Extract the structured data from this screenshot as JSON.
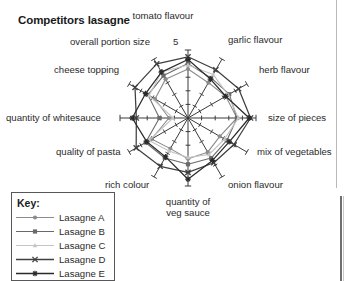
{
  "chart_title": "Competitors lasagne",
  "scale_top_label": "5",
  "legend": {
    "title": "Key:",
    "items": [
      {
        "label": "Lasagne A",
        "marker": "circle-marker",
        "color": "#8c8c8c"
      },
      {
        "label": "Lasagne B",
        "marker": "square-marker",
        "color": "#6a6a6a"
      },
      {
        "label": "Lasagne C",
        "marker": "triangle-marker",
        "color": "#c4c4c4"
      },
      {
        "label": "Lasagne D",
        "marker": "cross-marker",
        "color": "#3f3f3f"
      },
      {
        "label": "Lasagne E",
        "marker": "asterisk-marker",
        "color": "#2a2a2a"
      }
    ]
  },
  "chart_data": {
    "type": "radar",
    "title": "Competitors lasagne",
    "xlabel": "",
    "ylabel": "",
    "rlim": [
      0,
      5
    ],
    "r_ticks": [
      1,
      2,
      3,
      4,
      5
    ],
    "grid": false,
    "legend_position": "bottom-left",
    "categories": [
      "tomato flavour",
      "garlic flavour",
      "herb flavour",
      "size of pieces",
      "mix of vegetables",
      "onion flavour",
      "quantity of veg sauce",
      "rich colour",
      "quality of pasta",
      "quantity of whitesauce",
      "cheese topping",
      "overall portion size"
    ],
    "series": [
      {
        "name": "Lasagne A",
        "color": "#8c8c8c",
        "marker": "circle",
        "values": [
          3.6,
          3.0,
          3.2,
          3.6,
          2.7,
          2.9,
          3.0,
          2.6,
          3.1,
          1.4,
          2.8,
          3.3
        ]
      },
      {
        "name": "Lasagne B",
        "color": "#6a6a6a",
        "marker": "square",
        "values": [
          4.0,
          3.4,
          3.5,
          3.6,
          3.3,
          3.4,
          3.4,
          3.4,
          3.6,
          2.1,
          3.4,
          3.6
        ]
      },
      {
        "name": "Lasagne C",
        "color": "#c4c4c4",
        "marker": "triangle",
        "values": [
          3.9,
          3.7,
          3.4,
          3.7,
          3.1,
          3.1,
          2.9,
          2.8,
          3.3,
          1.1,
          3.3,
          3.9
        ]
      },
      {
        "name": "Lasagne D",
        "color": "#3f3f3f",
        "marker": "cross",
        "values": [
          4.5,
          4.1,
          4.3,
          4.6,
          3.9,
          3.8,
          4.0,
          4.1,
          4.4,
          3.8,
          4.5,
          4.6
        ]
      },
      {
        "name": "Lasagne E",
        "color": "#2a2a2a",
        "marker": "asterisk",
        "values": [
          4.3,
          3.3,
          3.2,
          4.5,
          3.5,
          3.6,
          4.5,
          3.3,
          3.5,
          4.1,
          3.6,
          3.9
        ]
      }
    ],
    "axis_label_positions": [
      {
        "label": "tomato flavour",
        "left": 163,
        "top": 10,
        "align": "center",
        "width": 0
      },
      {
        "label": "garlic flavour",
        "left": 228,
        "top": 34,
        "align": "left",
        "width": 0
      },
      {
        "label": "herb flavour",
        "left": 259,
        "top": 64,
        "align": "left",
        "width": 0
      },
      {
        "label": "size of pieces",
        "left": 268,
        "top": 112,
        "align": "left",
        "width": 0
      },
      {
        "label": "mix of vegetables",
        "left": 257,
        "top": 146,
        "align": "left",
        "width": 0
      },
      {
        "label": "onion flavour",
        "left": 228,
        "top": 179,
        "align": "left",
        "width": 0
      },
      {
        "label": "rich colour",
        "left": 105,
        "top": 179,
        "align": "left",
        "width": 0
      },
      {
        "label": "quality of pasta",
        "left": 56,
        "top": 146,
        "align": "left",
        "width": 0
      },
      {
        "label": "quantity of whitesauce",
        "left": 6,
        "top": 112,
        "align": "left",
        "width": 0
      },
      {
        "label": "cheese topping",
        "left": 54,
        "top": 64,
        "align": "left",
        "width": 0
      },
      {
        "label": "overall portion size",
        "left": 70,
        "top": 36,
        "align": "left",
        "width": 0
      }
    ],
    "bottom_label_lines": [
      "quantity of",
      "veg sauce"
    ]
  },
  "geometry": {
    "center_x": 188,
    "center_y": 118,
    "radius": 68,
    "axis_count": 12,
    "start_angle_deg": -90
  }
}
